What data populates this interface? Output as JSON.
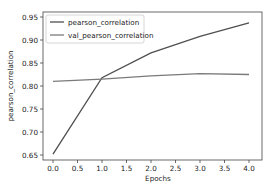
{
  "chart_data": {
    "type": "line",
    "title": "",
    "xlabel": "Epochs",
    "ylabel": "pearson_correlation",
    "x": [
      0,
      1,
      2,
      3,
      4
    ],
    "xticks": [
      "0.0",
      "0.5",
      "1.0",
      "1.5",
      "2.0",
      "2.5",
      "3.0",
      "3.5",
      "4.0"
    ],
    "yticks": [
      "0.65",
      "0.70",
      "0.75",
      "0.80",
      "0.85",
      "0.90",
      "0.95"
    ],
    "xlim": [
      -0.2,
      4.2
    ],
    "ylim": [
      0.64,
      0.955
    ],
    "grid": false,
    "legend_position": "upper left",
    "series": [
      {
        "name": "pearson_correlation",
        "values": [
          0.652,
          0.818,
          0.872,
          0.908,
          0.937
        ],
        "color": "#4f4f4f"
      },
      {
        "name": "val_pearson_correlation",
        "values": [
          0.81,
          0.815,
          0.822,
          0.827,
          0.825
        ],
        "color": "#7a7a7a"
      }
    ]
  }
}
